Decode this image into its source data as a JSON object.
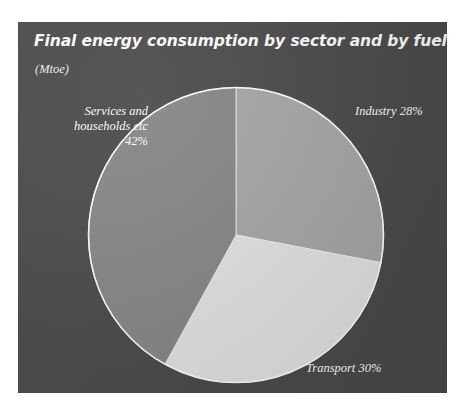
{
  "figure": {
    "panel_background": "#4a4a4a",
    "text_color": "#ffffff"
  },
  "chart_data": {
    "type": "pie",
    "title": "Final energy consumption by sector and by fuel in 1996",
    "subtitle": "(Mtoe)",
    "units": "Mtoe",
    "xlabel": "",
    "ylabel": "",
    "grid": false,
    "legend": "none",
    "labels_position": "outside",
    "start_angle_deg": 0,
    "direction": "clockwise",
    "categories": [
      "Industry",
      "Transport",
      "Services and households etc"
    ],
    "values": [
      28,
      30,
      42
    ],
    "value_suffix": "%",
    "colors": [
      "#a8a8a8",
      "#e4e4e2",
      "#878787"
    ],
    "slices": [
      {
        "name": "Industry",
        "value": 28,
        "label": "Industry 28%",
        "color": "#a8a8a8",
        "start_deg": 0,
        "end_deg": 100.8
      },
      {
        "name": "Transport",
        "value": 30,
        "label": "Transport 30%",
        "color": "#e4e4e2",
        "start_deg": 100.8,
        "end_deg": 208.8
      },
      {
        "name": "Services and households etc",
        "value": 42,
        "label": "Services and\nhouseholds etc\n42%",
        "color": "#878787",
        "start_deg": 208.8,
        "end_deg": 360
      }
    ]
  }
}
